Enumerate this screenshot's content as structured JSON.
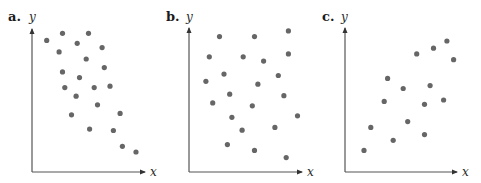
{
  "chart_data": [
    {
      "type": "scatter",
      "panel_label": "a.",
      "title": "",
      "xlabel": "x",
      "ylabel": "y",
      "xlim": [
        0,
        100
      ],
      "ylim": [
        0,
        100
      ],
      "grid": false,
      "trend": "negative",
      "points": [
        [
          13,
          92
        ],
        [
          27,
          97
        ],
        [
          50,
          97
        ],
        [
          24,
          84
        ],
        [
          40,
          90
        ],
        [
          62,
          87
        ],
        [
          48,
          79
        ],
        [
          27,
          70
        ],
        [
          64,
          73
        ],
        [
          42,
          66
        ],
        [
          29,
          59
        ],
        [
          55,
          59
        ],
        [
          69,
          60
        ],
        [
          39,
          53
        ],
        [
          58,
          47
        ],
        [
          35,
          40
        ],
        [
          78,
          41
        ],
        [
          51,
          30
        ],
        [
          72,
          29
        ],
        [
          80,
          18
        ],
        [
          92,
          14
        ]
      ]
    },
    {
      "type": "scatter",
      "panel_label": "b.",
      "title": "",
      "xlabel": "x",
      "ylabel": "y",
      "xlim": [
        0,
        100
      ],
      "ylim": [
        0,
        100
      ],
      "grid": false,
      "trend": "none",
      "points": [
        [
          27,
          94
        ],
        [
          58,
          94
        ],
        [
          88,
          98
        ],
        [
          18,
          80
        ],
        [
          48,
          80
        ],
        [
          66,
          77
        ],
        [
          88,
          82
        ],
        [
          31,
          68
        ],
        [
          15,
          63
        ],
        [
          61,
          61
        ],
        [
          79,
          67
        ],
        [
          36,
          54
        ],
        [
          21,
          48
        ],
        [
          56,
          46
        ],
        [
          84,
          53
        ],
        [
          38,
          38
        ],
        [
          96,
          39
        ],
        [
          47,
          29
        ],
        [
          76,
          31
        ],
        [
          34,
          19
        ],
        [
          58,
          15
        ],
        [
          86,
          10
        ]
      ]
    },
    {
      "type": "scatter",
      "panel_label": "c.",
      "title": "",
      "xlabel": "x",
      "ylabel": "y",
      "xlim": [
        0,
        100
      ],
      "ylim": [
        0,
        100
      ],
      "grid": false,
      "trend": "positive",
      "points": [
        [
          17,
          15
        ],
        [
          23,
          31
        ],
        [
          43,
          22
        ],
        [
          35,
          49
        ],
        [
          38,
          65
        ],
        [
          52,
          58
        ],
        [
          56,
          35
        ],
        [
          71,
          26
        ],
        [
          71,
          47
        ],
        [
          76,
          60
        ],
        [
          88,
          50
        ],
        [
          64,
          82
        ],
        [
          79,
          86
        ],
        [
          91,
          91
        ],
        [
          97,
          78
        ]
      ]
    }
  ],
  "colors": {
    "point": "#666666",
    "axis": "#555555"
  }
}
